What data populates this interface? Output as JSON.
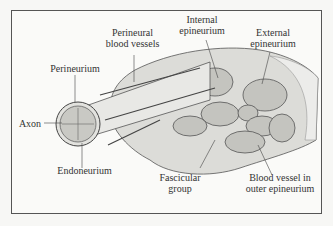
{
  "diagram": {
    "labels": {
      "perineural_blood_vessels": [
        "Perineural",
        "blood vessels"
      ],
      "internal_epineurium": [
        "Internal",
        "epineurium"
      ],
      "external_epineurium": [
        "External",
        "epineurium"
      ],
      "perineurium": "Perineurium",
      "axon": "Axon",
      "endoneurium": "Endoneurium",
      "fascicular_group": [
        "Fascicular",
        "group"
      ],
      "blood_vessel_outer_epineurium": [
        "Blood vessel in",
        "outer epineurium"
      ]
    },
    "colors": {
      "line": "#444444",
      "tissue": "#d9d9d6",
      "fascicle": "#bdbdb8",
      "background": "#fafaf8"
    }
  }
}
